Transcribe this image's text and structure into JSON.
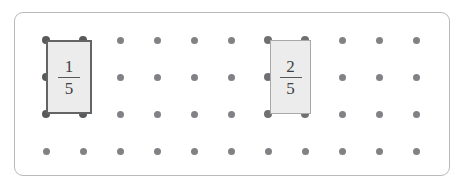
{
  "board": {
    "title": "Geoboard fraction model",
    "grid": {
      "columns": 11,
      "rows": 4,
      "origin_x": 46,
      "origin_y": 40,
      "spacing_x": 37,
      "spacing_y": 37,
      "dot_color": "#808285",
      "corner_dot_color": "#58595b"
    },
    "frame": {
      "border_color": "#b9b9b9",
      "radius": 9,
      "background": "#ffffff"
    }
  },
  "shapes": [
    {
      "id": "shape-one-fifth",
      "name": "rectangle-one-fifth",
      "numerator": "1",
      "denominator": "5",
      "style": "dark",
      "fill": "#ececec",
      "border_color": "#636466",
      "left": 46,
      "top": 40,
      "width": 46,
      "height": 74,
      "grid_col": 1,
      "grid_row": 1,
      "span_cols": 1,
      "span_rows": 2
    },
    {
      "id": "shape-two-fifths",
      "name": "rectangle-two-fifths",
      "numerator": "2",
      "denominator": "5",
      "style": "light",
      "fill": "#ececec",
      "border_color": "#a6a8ab",
      "left": 270,
      "top": 40,
      "width": 41,
      "height": 74,
      "grid_col": 7,
      "grid_row": 1,
      "span_cols": 1,
      "span_rows": 2
    }
  ]
}
